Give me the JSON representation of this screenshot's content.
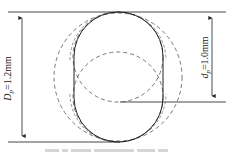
{
  "diagram": {
    "type": "geometry-schematic",
    "labels": {
      "outer_dim": {
        "symbol": "D",
        "subscript": "p",
        "value": "=1.2mm"
      },
      "inner_dim": {
        "symbol": "d",
        "subscript": "p",
        "value": "=1.0mm"
      }
    },
    "shapes": [
      {
        "kind": "capsule",
        "style": "solid",
        "x": 74,
        "y": 12,
        "width": 89,
        "height": 130
      },
      {
        "kind": "circle",
        "style": "dashed",
        "cx": 118,
        "cy": 77,
        "r": 64
      },
      {
        "kind": "circle",
        "style": "dashed",
        "cx": 118,
        "cy": 57,
        "r": 45
      },
      {
        "kind": "circle",
        "style": "dashed",
        "cx": 118,
        "cy": 97,
        "r": 45
      }
    ],
    "dimension_lines": {
      "top_y": 12,
      "bottom_y": 142,
      "inner_bottom_y": 102,
      "left_arrow_x": 22,
      "right_arrow_x": 212
    },
    "colors": {
      "line": "#333333",
      "dashed": "#555555",
      "background": "#ffffff"
    },
    "caption": ""
  }
}
